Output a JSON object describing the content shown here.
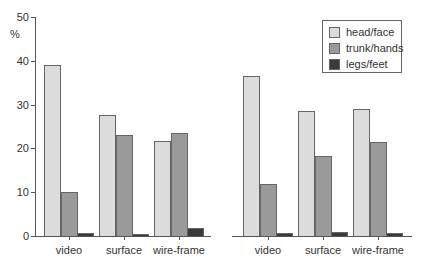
{
  "chart_data": [
    {
      "type": "bar",
      "title": "",
      "xlabel": "",
      "ylabel": "%",
      "ylim": [
        0,
        50
      ],
      "yticks": [
        0,
        10,
        20,
        30,
        40,
        50
      ],
      "categories": [
        "video",
        "surface",
        "wire-frame"
      ],
      "series": [
        {
          "name": "head/face",
          "values": [
            39.0,
            27.6,
            21.8
          ],
          "color": "#dcdcdc"
        },
        {
          "name": "trunk/hands",
          "values": [
            10.0,
            23.0,
            23.5
          ],
          "color": "#9a9a9a"
        },
        {
          "name": "legs/feet",
          "values": [
            0.6,
            0.4,
            1.9
          ],
          "color": "#3a3a3a"
        }
      ],
      "legend": false
    },
    {
      "type": "bar",
      "title": "",
      "xlabel": "",
      "ylabel": "",
      "ylim": [
        0,
        50
      ],
      "categories": [
        "video",
        "surface",
        "wire-frame"
      ],
      "series": [
        {
          "name": "head/face",
          "values": [
            36.6,
            28.5,
            29.0
          ],
          "color": "#dcdcdc"
        },
        {
          "name": "trunk/hands",
          "values": [
            11.8,
            18.3,
            21.5
          ],
          "color": "#9a9a9a"
        },
        {
          "name": "legs/feet",
          "values": [
            0.7,
            1.0,
            0.6
          ],
          "color": "#3a3a3a"
        }
      ],
      "legend": true,
      "legend_position": "upper right"
    }
  ],
  "axis": {
    "ylabel": "%",
    "yticks": [
      "0",
      "10",
      "20",
      "30",
      "40",
      "50"
    ]
  },
  "categories": [
    "video",
    "surface",
    "wire-frame"
  ],
  "legend": {
    "items": [
      {
        "label": "head/face",
        "color": "#dcdcdc"
      },
      {
        "label": "trunk/hands",
        "color": "#9a9a9a"
      },
      {
        "label": "legs/feet",
        "color": "#3a3a3a"
      }
    ]
  }
}
